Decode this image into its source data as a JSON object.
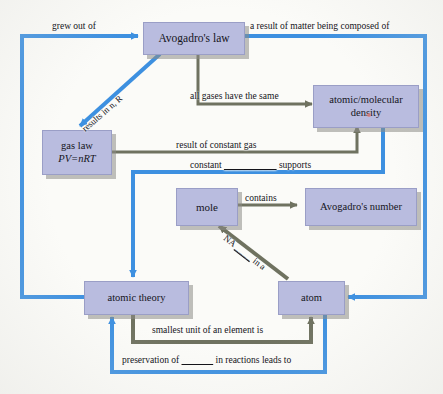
{
  "diagram": {
    "colors": {
      "node_fill": "#b9bcdf",
      "node_border": "#9a9ec6",
      "blue_edge": "#3d90e0",
      "gray_edge": "#6f7260",
      "background": "#fbfbf8",
      "shadow": "#8c8c86",
      "red_mark": "#d9807c"
    },
    "nodes": [
      {
        "id": "avogadros-law",
        "label": "Avogadro's law",
        "label2": ""
      },
      {
        "id": "gas-law",
        "label": "gas law",
        "label2": "PV=nRT"
      },
      {
        "id": "atomic-molecular-density",
        "label": "atomic/molecular",
        "label2": "density"
      },
      {
        "id": "mole",
        "label": "mole",
        "label2": ""
      },
      {
        "id": "avogadros-number",
        "label": "Avogadro's number",
        "label2": ""
      },
      {
        "id": "atomic-theory",
        "label": "atomic theory",
        "label2": ""
      },
      {
        "id": "atom",
        "label": "atom",
        "label2": ""
      }
    ],
    "edges": [
      {
        "id": "atomic-theory-to-avogadros-law",
        "label": "grew out of",
        "color": "blue"
      },
      {
        "id": "avogadros-law-to-atom",
        "label": "a result of matter being composed of",
        "color": "blue"
      },
      {
        "id": "avogadros-law-to-gas-law",
        "label": "results in ",
        "label_italic": "n, R",
        "color": "blue"
      },
      {
        "id": "avogadros-law-to-density",
        "label": "all gases have the same",
        "color": "gray"
      },
      {
        "id": "gas-law-to-density",
        "label": "result of constant gas",
        "color": "gray"
      },
      {
        "id": "density-to-atomic-theory",
        "label_pre": "constant ",
        "label_blank": "__________",
        "label_post": " supports",
        "color": "blue"
      },
      {
        "id": "mole-to-avogadros-number",
        "label": "contains",
        "color": "gray"
      },
      {
        "id": "atom-to-mole",
        "label_pre": "NA ",
        "label_blank": "____",
        "label_post": " in a",
        "color": "gray"
      },
      {
        "id": "atomic-theory-to-atom",
        "label": "smallest unit of an element is",
        "color": "gray"
      },
      {
        "id": "atom-to-atomic-theory",
        "label_pre": "preservation of ",
        "label_blank": "______",
        "label_post": " in reactions leads to",
        "color": "blue"
      }
    ]
  }
}
